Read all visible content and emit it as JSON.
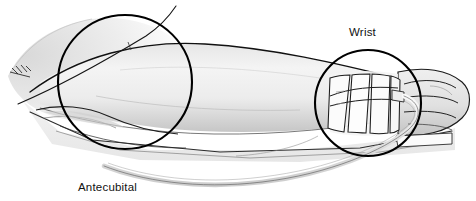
{
  "illustration": {
    "title": "Arm with peripheral IV catheter secured at the wrist",
    "subject": "human forearm and hand resting on a flat surface",
    "view": "lateral / side view, hand at right"
  },
  "labels": {
    "wrist": "Wrist",
    "antecubital_fossa_line1": "Antecubital",
    "antecubital_fossa_line2": "fossa"
  },
  "callouts": [
    {
      "name": "antecubital-fossa-circle",
      "label": "Antecubital fossa",
      "cx": 125,
      "cy": 82,
      "r": 67
    },
    {
      "name": "wrist-circle",
      "label": "Wrist",
      "cx": 368,
      "cy": 103,
      "r": 53
    }
  ],
  "anatomy": [
    {
      "name": "upper-arm",
      "description": "proximal upper arm entering frame at left"
    },
    {
      "name": "elbow-antecubital-fossa",
      "description": "inner elbow crease"
    },
    {
      "name": "forearm",
      "description": "forearm extending to the right"
    },
    {
      "name": "hand",
      "description": "hand with flexed fingers at right"
    },
    {
      "name": "support-surface",
      "description": "flat armboard / bed surface under arm"
    }
  ],
  "device": {
    "name": "iv-catheter-and-tubing",
    "securement": "tape strips wrapped around the wrist",
    "tape_strip_count": 4,
    "tubing": "IV extension tubing looping down and back to the left"
  },
  "icons": {
    "artist-signature": "artist-signature-mark"
  },
  "colors": {
    "skin_light": "#f2f2f2",
    "skin_mid": "#e2e2e2",
    "skin_shadow": "#c9c9c9",
    "outline": "#1a1a1a",
    "callout_stroke": "#000000",
    "tape_fill": "#fbfbfb",
    "tubing": "#d8d8d8",
    "label_text": "#111111",
    "background": "#ffffff"
  }
}
